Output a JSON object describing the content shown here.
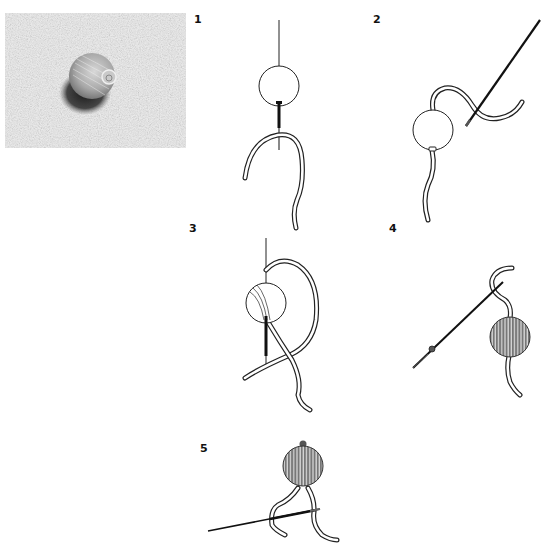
{
  "figure": {
    "top_text_cutoff": "(text cut off at top edge, unreadable)"
  },
  "photo": {
    "subject": "Photo of thread-wrapped bead on linen fabric",
    "tone": "grayscale"
  },
  "steps": [
    {
      "label": "1",
      "description": "Needle threaded through a plain round bead; doubled thread hanging below"
    },
    {
      "label": "2",
      "description": "Thread passes over the bead; needle points up-right"
    },
    {
      "label": "3",
      "description": "Thread wrapped around bead several times, forming a loop; needle through the center"
    },
    {
      "label": "4",
      "description": "Bead fully wrapped with striped thread; needle angled diagonally down-left"
    },
    {
      "label": "5",
      "description": "Finished wrapped bead with a small knot at top; needle below, thread ends hanging"
    }
  ],
  "colors": {
    "line": "#222222",
    "thread_fill": "#ffffff",
    "wrapped_bead": "#7a7a7a",
    "background": "#ffffff"
  }
}
